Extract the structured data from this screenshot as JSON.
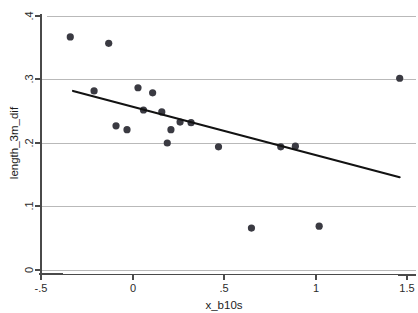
{
  "chart_data": {
    "type": "scatter",
    "title": "",
    "xlabel": "x_b10s",
    "ylabel": "length_3m_dif",
    "xlim": [
      -0.5,
      1.5
    ],
    "ylim": [
      0.0,
      0.4
    ],
    "xticks": [
      -0.5,
      0,
      0.5,
      1,
      1.5
    ],
    "xtick_labels": [
      "-.5",
      "0",
      ".5",
      "1",
      "1.5"
    ],
    "yticks": [
      0,
      0.1,
      0.2,
      0.3,
      0.4
    ],
    "ytick_labels": [
      "0",
      ".1",
      ".2",
      ".3",
      ".4"
    ],
    "grid": "horizontal",
    "legend": "none",
    "marker": "filled-circle",
    "marker_color": "#3a3a42",
    "line_color": "#121212",
    "points": [
      {
        "x": -0.34,
        "y": 0.367
      },
      {
        "x": -0.13,
        "y": 0.357
      },
      {
        "x": -0.21,
        "y": 0.282
      },
      {
        "x": -0.09,
        "y": 0.227
      },
      {
        "x": 0.03,
        "y": 0.287
      },
      {
        "x": 0.11,
        "y": 0.279
      },
      {
        "x": -0.03,
        "y": 0.221
      },
      {
        "x": 0.06,
        "y": 0.252
      },
      {
        "x": 0.16,
        "y": 0.249
      },
      {
        "x": 0.21,
        "y": 0.221
      },
      {
        "x": 0.26,
        "y": 0.233
      },
      {
        "x": 0.32,
        "y": 0.232
      },
      {
        "x": 0.19,
        "y": 0.2
      },
      {
        "x": 0.47,
        "y": 0.194
      },
      {
        "x": 0.81,
        "y": 0.194
      },
      {
        "x": 0.89,
        "y": 0.195
      },
      {
        "x": 0.65,
        "y": 0.066
      },
      {
        "x": 1.02,
        "y": 0.069
      },
      {
        "x": 1.46,
        "y": 0.302
      }
    ],
    "fit_line": {
      "label": "linear fit",
      "x_start": -0.325,
      "y_start": 0.282,
      "x_end": 1.46,
      "y_end": 0.146
    }
  }
}
